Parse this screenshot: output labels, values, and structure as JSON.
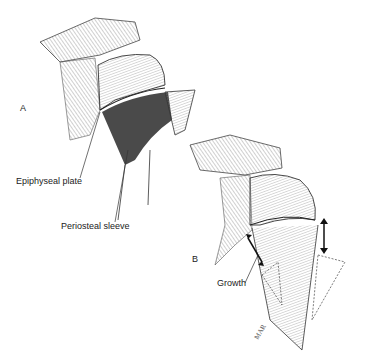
{
  "figure": {
    "panels": [
      {
        "id": "A",
        "label": "A"
      },
      {
        "id": "B",
        "label": "B"
      }
    ],
    "annotations": {
      "epiphyseal_plate": "Epiphyseal plate",
      "periosteal_sleeve": "Periosteal sleeve",
      "growth": "Growth"
    },
    "signature": "MAR"
  }
}
